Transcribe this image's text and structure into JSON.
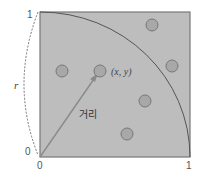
{
  "diagram": {
    "title": "",
    "square": {
      "fill": "#bdbdbd",
      "stroke": "#777777"
    },
    "arc": {
      "stroke": "#555555"
    },
    "arrow": {
      "stroke": "#8a8a8a"
    },
    "point_fill": "#a8a8a8",
    "labels": {
      "y_top": "1",
      "radius": "r",
      "origin_left": "0",
      "origin_bottom": "0",
      "x_right": "1",
      "point": "(x, y)",
      "distance": "거리"
    },
    "points": [
      {
        "x": 0.15,
        "y": 0.59
      },
      {
        "x": 0.4,
        "y": 0.59
      },
      {
        "x": 0.75,
        "y": 0.91
      },
      {
        "x": 0.88,
        "y": 0.63
      },
      {
        "x": 0.7,
        "y": 0.39
      },
      {
        "x": 0.58,
        "y": 0.16
      }
    ]
  }
}
